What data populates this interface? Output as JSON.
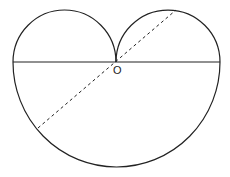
{
  "diagram": {
    "labels": {
      "center_point": "O"
    },
    "colors": {
      "stroke": "#222222",
      "background": "#ffffff"
    }
  }
}
